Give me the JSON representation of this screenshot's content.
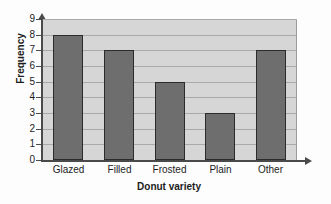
{
  "chart_data": {
    "type": "bar",
    "title": "",
    "xlabel": "Donut variety",
    "ylabel": "Frequency",
    "categories": [
      "Glazed",
      "Filled",
      "Frosted",
      "Plain",
      "Other"
    ],
    "values": [
      8,
      7,
      5,
      3,
      7
    ],
    "ylim": [
      0,
      9
    ],
    "ytick_labels": [
      "0",
      "1",
      "2",
      "3",
      "4",
      "5",
      "6",
      "7",
      "8",
      "9"
    ],
    "ytick_values": [
      0,
      1,
      2,
      3,
      4,
      5,
      6,
      7,
      8,
      9
    ],
    "grid": "horizontal",
    "legend": "none",
    "colors": {
      "bar_fill": "#6e6e6e",
      "bar_edge": "#2b2b2b",
      "plot_background": "#d6d6d6",
      "gridline": "#a9a9a9",
      "axis": "#4a4a4a",
      "text": "#1c1c1c",
      "figure_background": "#fdfdfd"
    },
    "axis_arrows": {
      "x": "right-arrow",
      "y": "up-arrow"
    }
  }
}
